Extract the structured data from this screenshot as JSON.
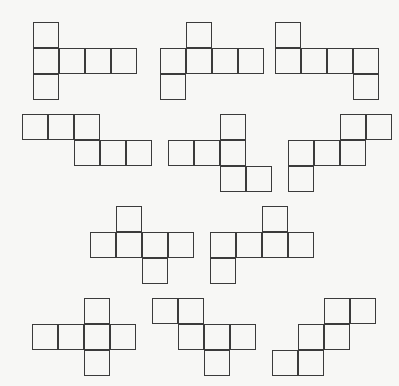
{
  "figure": {
    "title": "",
    "caption": "",
    "background_color": "#f7f7f5",
    "stroke_color": "#3b3b3b",
    "fill_color": "transparent",
    "cell_size": 26,
    "canvas": {
      "width": 399,
      "height": 386
    },
    "shape_count": 11,
    "cells_per_shape": 6,
    "shapes": [
      {
        "id": "shape-1",
        "name": "hexomino-1",
        "row": 1,
        "column": 1,
        "origin": {
          "x": 33,
          "y": 22
        },
        "grid_cols": 4,
        "grid_rows": 3,
        "cells": [
          [
            0,
            0
          ],
          [
            0,
            1
          ],
          [
            1,
            1
          ],
          [
            2,
            1
          ],
          [
            3,
            1
          ],
          [
            0,
            2
          ]
        ]
      },
      {
        "id": "shape-2",
        "name": "hexomino-2",
        "row": 1,
        "column": 2,
        "origin": {
          "x": 160,
          "y": 22
        },
        "grid_cols": 4,
        "grid_rows": 3,
        "cells": [
          [
            1,
            0
          ],
          [
            0,
            1
          ],
          [
            1,
            1
          ],
          [
            2,
            1
          ],
          [
            3,
            1
          ],
          [
            0,
            2
          ]
        ]
      },
      {
        "id": "shape-3",
        "name": "hexomino-3",
        "row": 1,
        "column": 3,
        "origin": {
          "x": 275,
          "y": 22
        },
        "grid_cols": 4,
        "grid_rows": 3,
        "cells": [
          [
            0,
            0
          ],
          [
            0,
            1
          ],
          [
            1,
            1
          ],
          [
            2,
            1
          ],
          [
            3,
            1
          ],
          [
            3,
            2
          ]
        ]
      },
      {
        "id": "shape-4",
        "name": "hexomino-4",
        "row": 2,
        "column": 1,
        "origin": {
          "x": 22,
          "y": 114
        },
        "grid_cols": 5,
        "grid_rows": 2,
        "cells": [
          [
            0,
            0
          ],
          [
            1,
            0
          ],
          [
            2,
            0
          ],
          [
            2,
            1
          ],
          [
            3,
            1
          ],
          [
            4,
            1
          ]
        ]
      },
      {
        "id": "shape-5",
        "name": "hexomino-5",
        "row": 2,
        "column": 2,
        "origin": {
          "x": 168,
          "y": 114
        },
        "grid_cols": 4,
        "grid_rows": 3,
        "cells": [
          [
            2,
            0
          ],
          [
            0,
            1
          ],
          [
            1,
            1
          ],
          [
            2,
            1
          ],
          [
            2,
            2
          ],
          [
            3,
            2
          ]
        ]
      },
      {
        "id": "shape-6",
        "name": "hexomino-6",
        "row": 2,
        "column": 3,
        "origin": {
          "x": 288,
          "y": 114
        },
        "grid_cols": 4,
        "grid_rows": 3,
        "cells": [
          [
            2,
            0
          ],
          [
            3,
            0
          ],
          [
            0,
            1
          ],
          [
            1,
            1
          ],
          [
            2,
            1
          ],
          [
            0,
            2
          ]
        ]
      },
      {
        "id": "shape-7",
        "name": "hexomino-7",
        "row": 3,
        "column": 1,
        "origin": {
          "x": 90,
          "y": 206
        },
        "grid_cols": 4,
        "grid_rows": 3,
        "cells": [
          [
            1,
            0
          ],
          [
            0,
            1
          ],
          [
            1,
            1
          ],
          [
            2,
            1
          ],
          [
            3,
            1
          ],
          [
            2,
            2
          ]
        ]
      },
      {
        "id": "shape-8",
        "name": "hexomino-8",
        "row": 3,
        "column": 2,
        "origin": {
          "x": 210,
          "y": 206
        },
        "grid_cols": 4,
        "grid_rows": 3,
        "cells": [
          [
            2,
            0
          ],
          [
            0,
            1
          ],
          [
            1,
            1
          ],
          [
            2,
            1
          ],
          [
            3,
            1
          ],
          [
            0,
            2
          ]
        ]
      },
      {
        "id": "shape-9",
        "name": "hexomino-9",
        "row": 4,
        "column": 1,
        "origin": {
          "x": 32,
          "y": 298
        },
        "grid_cols": 4,
        "grid_rows": 3,
        "cells": [
          [
            2,
            0
          ],
          [
            0,
            1
          ],
          [
            1,
            1
          ],
          [
            2,
            1
          ],
          [
            3,
            1
          ],
          [
            2,
            2
          ]
        ]
      },
      {
        "id": "shape-10",
        "name": "hexomino-10",
        "row": 4,
        "column": 2,
        "origin": {
          "x": 152,
          "y": 298
        },
        "grid_cols": 4,
        "grid_rows": 3,
        "cells": [
          [
            0,
            0
          ],
          [
            1,
            0
          ],
          [
            1,
            1
          ],
          [
            2,
            1
          ],
          [
            3,
            1
          ],
          [
            2,
            2
          ]
        ]
      },
      {
        "id": "shape-11",
        "name": "hexomino-11",
        "row": 4,
        "column": 3,
        "origin": {
          "x": 272,
          "y": 298
        },
        "grid_cols": 4,
        "grid_rows": 3,
        "cells": [
          [
            2,
            0
          ],
          [
            3,
            0
          ],
          [
            1,
            1
          ],
          [
            2,
            1
          ],
          [
            0,
            2
          ],
          [
            1,
            2
          ]
        ]
      }
    ]
  }
}
